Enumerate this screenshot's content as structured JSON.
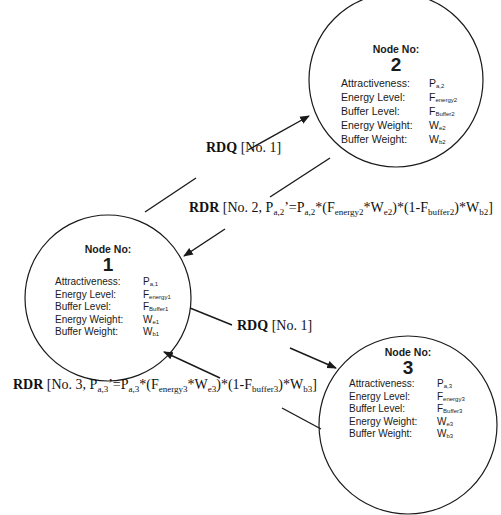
{
  "nodes": [
    {
      "id": 1,
      "title": "Node No:",
      "number": "1",
      "fields": [
        {
          "label": "Attractiveness:",
          "symbol": "P",
          "sub": "a,1"
        },
        {
          "label": "Energy Level:",
          "symbol": "F",
          "sub": "energy1"
        },
        {
          "label": "Buffer Level:",
          "symbol": "F",
          "sub": "Buffer1"
        },
        {
          "label": "Energy Weight:",
          "symbol": "W",
          "sub": "e1"
        },
        {
          "label": "Buffer Weight:",
          "symbol": "W",
          "sub": "b1"
        }
      ]
    },
    {
      "id": 2,
      "title": "Node No:",
      "number": "2",
      "fields": [
        {
          "label": "Attractiveness:",
          "symbol": "P",
          "sub": "a,2"
        },
        {
          "label": "Energy Level:",
          "symbol": "F",
          "sub": "energy2"
        },
        {
          "label": "Buffer Level:",
          "symbol": "F",
          "sub": "Buffer2"
        },
        {
          "label": "Energy Weight:",
          "symbol": "W",
          "sub": "e2"
        },
        {
          "label": "Buffer Weight:",
          "symbol": "W",
          "sub": "b2"
        }
      ]
    },
    {
      "id": 3,
      "title": "Node No:",
      "number": "3",
      "fields": [
        {
          "label": "Attractiveness:",
          "symbol": "P",
          "sub": "a,3"
        },
        {
          "label": "Energy Level:",
          "symbol": "F",
          "sub": "energy3"
        },
        {
          "label": "Buffer Level:",
          "symbol": "F",
          "sub": "Buffer3"
        },
        {
          "label": "Energy Weight:",
          "symbol": "W",
          "sub": "e3"
        },
        {
          "label": "Buffer Weight:",
          "symbol": "W",
          "sub": "b3"
        }
      ]
    }
  ],
  "edges": [
    {
      "from": 1,
      "to": 2,
      "type": "RDQ",
      "label_bold": "RDQ",
      "label_rest": " [No. 1]"
    },
    {
      "from": 2,
      "to": 1,
      "type": "RDR",
      "label_bold": "RDR",
      "label_parts": [
        {
          "t": " [No. 2, P"
        },
        {
          "s": "a,2"
        },
        {
          "t": "’=P"
        },
        {
          "s": "a,2"
        },
        {
          "t": "*(F"
        },
        {
          "s": "energy2"
        },
        {
          "t": "*W"
        },
        {
          "s": "e2"
        },
        {
          "t": ")*(1-F"
        },
        {
          "s": "buffer2"
        },
        {
          "t": ")*W"
        },
        {
          "s": "b2"
        },
        {
          "t": "]"
        }
      ]
    },
    {
      "from": 1,
      "to": 3,
      "type": "RDQ",
      "label_bold": "RDQ",
      "label_rest": " [No. 1]"
    },
    {
      "from": 3,
      "to": 1,
      "type": "RDR",
      "label_bold": "RDR",
      "label_parts": [
        {
          "t": " [No. 3, P"
        },
        {
          "s": "a,3"
        },
        {
          "t": "’=P"
        },
        {
          "s": "a,3"
        },
        {
          "t": "*(F"
        },
        {
          "s": "energy3"
        },
        {
          "t": "*W"
        },
        {
          "s": "e3"
        },
        {
          "t": ")*(1-F"
        },
        {
          "s": "buffer3"
        },
        {
          "t": ")*W"
        },
        {
          "s": "b3"
        },
        {
          "t": "]"
        }
      ]
    }
  ],
  "style": {
    "line_color": "#1a1a1a",
    "background": "#ffffff"
  }
}
